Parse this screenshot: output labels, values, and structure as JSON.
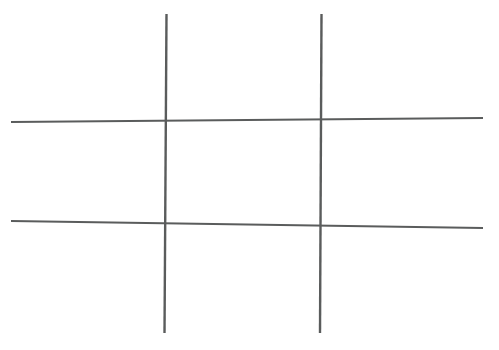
{
  "canvas": {
    "width": 499,
    "height": 350,
    "background_color": "#ffffff",
    "title": "Tic Tac Toe Grid"
  },
  "figure": {
    "name": "tic-tac-toe-grid",
    "line_color": "#5a5c5c",
    "line_width_vertical": 2.4,
    "line_width_horizontal": 2.2,
    "cell_count": 9,
    "marks_placed": 0
  },
  "lines": [
    {
      "id": "vertical-line-left",
      "orientation": "vertical",
      "x1": 166.5,
      "y1": 14,
      "x2": 164.5,
      "y2": 333,
      "stroke": "#5a5c5c",
      "stroke_width": 2.4
    },
    {
      "id": "vertical-line-right",
      "orientation": "vertical",
      "x1": 321.5,
      "y1": 14,
      "x2": 320.0,
      "y2": 333,
      "stroke": "#5a5c5c",
      "stroke_width": 2.4
    },
    {
      "id": "horizontal-line-top",
      "orientation": "horizontal",
      "x1": 11,
      "y1": 122,
      "x2": 483,
      "y2": 118,
      "stroke": "#5a5c5c",
      "stroke_width": 2.2
    },
    {
      "id": "horizontal-line-bottom",
      "orientation": "horizontal",
      "x1": 11,
      "y1": 221,
      "x2": 483,
      "y2": 228,
      "stroke": "#5a5c5c",
      "stroke_width": 2.2
    }
  ],
  "intersections": [
    {
      "id": "intersection-top-left",
      "x": 166,
      "y": 121
    },
    {
      "id": "intersection-top-right",
      "x": 321,
      "y": 120
    },
    {
      "id": "intersection-bottom-left",
      "x": 166,
      "y": 224
    },
    {
      "id": "intersection-bottom-right",
      "x": 321,
      "y": 225
    }
  ],
  "cells": [
    {
      "id": "cell-1",
      "row": 0,
      "col": 0,
      "mark": ""
    },
    {
      "id": "cell-2",
      "row": 0,
      "col": 1,
      "mark": ""
    },
    {
      "id": "cell-3",
      "row": 0,
      "col": 2,
      "mark": ""
    },
    {
      "id": "cell-4",
      "row": 1,
      "col": 0,
      "mark": ""
    },
    {
      "id": "cell-5",
      "row": 1,
      "col": 1,
      "mark": ""
    },
    {
      "id": "cell-6",
      "row": 1,
      "col": 2,
      "mark": ""
    },
    {
      "id": "cell-7",
      "row": 2,
      "col": 0,
      "mark": ""
    },
    {
      "id": "cell-8",
      "row": 2,
      "col": 1,
      "mark": ""
    },
    {
      "id": "cell-9",
      "row": 2,
      "col": 2,
      "mark": ""
    }
  ]
}
